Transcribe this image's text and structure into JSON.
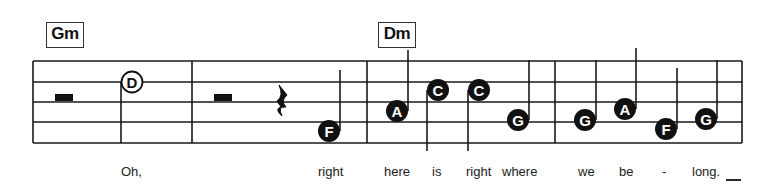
{
  "chords": [
    {
      "label": "Gm",
      "x": 46,
      "y": 22,
      "w": 36,
      "h": 24
    },
    {
      "label": "Dm",
      "x": 378,
      "y": 22,
      "w": 36,
      "h": 24
    }
  ],
  "staff": {
    "left": 33,
    "right": 742,
    "lines_y": [
      61,
      82,
      102,
      122,
      143
    ],
    "barlines_x": [
      33,
      192,
      367,
      555,
      742
    ]
  },
  "rests": [
    {
      "type": "half",
      "x": 55,
      "y": 94,
      "w": 18,
      "h": 7
    },
    {
      "type": "half",
      "x": 214,
      "y": 94,
      "w": 18,
      "h": 7
    },
    {
      "type": "quarter",
      "x": 283,
      "y": 101
    }
  ],
  "notes": [
    {
      "letter": "D",
      "cx": 132,
      "cy": 82,
      "style": "open",
      "stem_x": 121,
      "stem_y1": 82,
      "stem_y2": 143
    },
    {
      "letter": "F",
      "cx": 329,
      "cy": 131,
      "style": "filled",
      "stem_x": 340,
      "stem_y1": 131,
      "stem_y2": 70
    },
    {
      "letter": "A",
      "cx": 397,
      "cy": 111,
      "style": "filled",
      "stem_x": 408,
      "stem_y1": 111,
      "stem_y2": 50
    },
    {
      "letter": "C",
      "cx": 438,
      "cy": 90,
      "style": "filled",
      "stem_x": 427,
      "stem_y1": 90,
      "stem_y2": 151
    },
    {
      "letter": "C",
      "cx": 479,
      "cy": 90,
      "style": "filled",
      "stem_x": 468,
      "stem_y1": 90,
      "stem_y2": 151
    },
    {
      "letter": "G",
      "cx": 518,
      "cy": 120,
      "style": "filled",
      "stem_x": 529,
      "stem_y1": 120,
      "stem_y2": 60
    },
    {
      "letter": "G",
      "cx": 585,
      "cy": 120,
      "style": "filled",
      "stem_x": 596,
      "stem_y1": 120,
      "stem_y2": 60
    },
    {
      "letter": "A",
      "cx": 625,
      "cy": 109,
      "style": "filled",
      "stem_x": 636,
      "stem_y1": 109,
      "stem_y2": 48
    },
    {
      "letter": "F",
      "cx": 666,
      "cy": 129,
      "style": "filled",
      "stem_x": 677,
      "stem_y1": 129,
      "stem_y2": 68
    },
    {
      "letter": "G",
      "cx": 706,
      "cy": 119,
      "style": "filled",
      "stem_x": 717,
      "stem_y1": 119,
      "stem_y2": 60
    }
  ],
  "lyrics": [
    {
      "text": "Oh,",
      "x": 121
    },
    {
      "text": "right",
      "x": 318
    },
    {
      "text": "here",
      "x": 384
    },
    {
      "text": "is",
      "x": 432
    },
    {
      "text": "right",
      "x": 466
    },
    {
      "text": "where",
      "x": 502
    },
    {
      "text": "we",
      "x": 578
    },
    {
      "text": "be",
      "x": 619
    },
    {
      "text": "-",
      "x": 662
    },
    {
      "text": "long.",
      "x": 692
    }
  ],
  "extender": {
    "x1": 726,
    "x2": 741,
    "y": 180
  }
}
